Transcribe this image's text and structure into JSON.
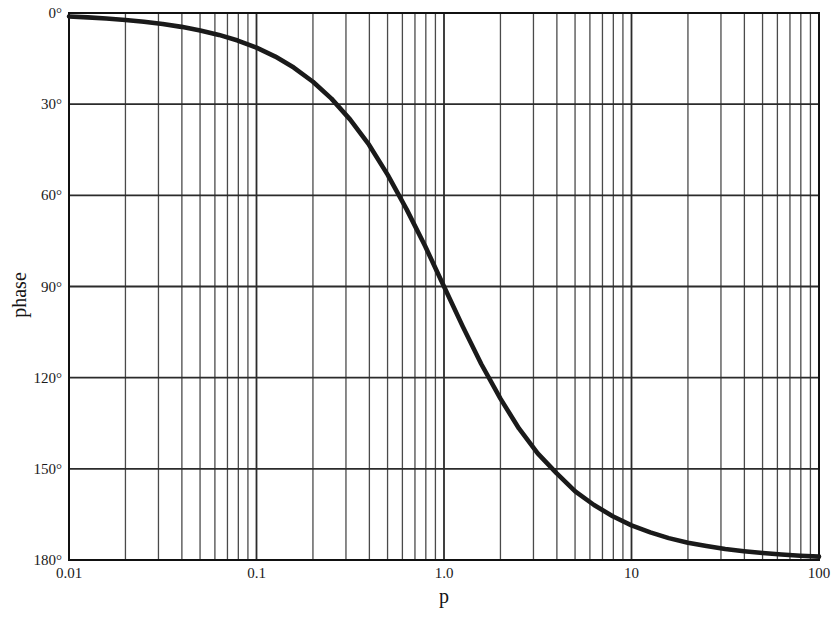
{
  "figure": {
    "xlabel": "p",
    "ylabel": "phase",
    "caption": ""
  },
  "axes": {
    "x_tick_labels": [
      "0.01",
      "0.1",
      "1.0",
      "10",
      "100"
    ],
    "y_tick_labels": [
      "0°",
      "30°",
      "60°",
      "90°",
      "120°",
      "150°",
      "180°"
    ]
  },
  "colors": {
    "curve": "#1a1a1a",
    "grid_major": "#2b2b2b",
    "grid_minor": "#4a4a4a",
    "frame": "#111111",
    "background": "#ffffff"
  },
  "chart_data": {
    "type": "line",
    "title": "",
    "xlabel": "p",
    "ylabel": "phase",
    "xscale": "log",
    "yscale": "linear",
    "xlim": [
      0.01,
      100
    ],
    "ylim": [
      0,
      180
    ],
    "y_inverted": true,
    "grid": true,
    "legend": false,
    "x_ticks": [
      0.01,
      0.1,
      1.0,
      10,
      100
    ],
    "x_tick_labels": [
      "0.01",
      "0.1",
      "1.0",
      "10",
      "100"
    ],
    "y_ticks": [
      0,
      30,
      60,
      90,
      120,
      150,
      180
    ],
    "y_tick_labels": [
      "0°",
      "30°",
      "60°",
      "90°",
      "120°",
      "150°",
      "180°"
    ],
    "x_minor_ticks_per_decade": [
      2,
      3,
      4,
      5,
      6,
      7,
      8,
      9
    ],
    "series": [
      {
        "name": "phase",
        "formula": "phase = 2*atan(p) in degrees",
        "x": [
          0.01,
          0.0126,
          0.0158,
          0.02,
          0.0251,
          0.0316,
          0.0398,
          0.0501,
          0.0631,
          0.0794,
          0.1,
          0.126,
          0.158,
          0.2,
          0.251,
          0.316,
          0.398,
          0.501,
          0.631,
          0.794,
          1.0,
          1.26,
          1.58,
          2.0,
          2.51,
          3.16,
          3.98,
          5.01,
          6.31,
          7.94,
          10.0,
          12.6,
          15.8,
          20.0,
          25.1,
          31.6,
          39.8,
          50.1,
          63.1,
          79.4,
          100.0
        ],
        "y": [
          1.15,
          1.44,
          1.81,
          2.29,
          2.88,
          3.62,
          4.56,
          5.73,
          7.21,
          9.06,
          11.42,
          14.33,
          17.96,
          22.62,
          28.18,
          35.08,
          43.33,
          53.26,
          64.54,
          76.78,
          90.0,
          103.2,
          115.5,
          126.9,
          136.7,
          144.9,
          151.4,
          157.4,
          161.9,
          165.6,
          168.6,
          170.9,
          172.8,
          174.3,
          175.4,
          176.4,
          177.1,
          177.7,
          178.2,
          178.6,
          178.9
        ]
      }
    ]
  }
}
